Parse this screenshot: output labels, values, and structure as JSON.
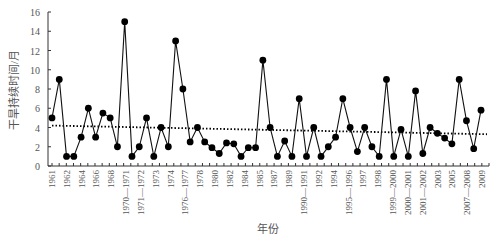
{
  "chart_data": {
    "type": "line",
    "title": "",
    "xlabel": "年份",
    "ylabel": "干旱持续时间/月",
    "ylim": [
      0,
      16
    ],
    "yticks": [
      0,
      2,
      4,
      6,
      8,
      10,
      12,
      14,
      16
    ],
    "grid": false,
    "legend": null,
    "x_tick_labels": [
      "1961",
      "1962",
      "1964",
      "1966",
      "1968",
      "1970—1971",
      "1971—1972",
      "1973",
      "1974",
      "1976—1977",
      "1978",
      "1980",
      "1982",
      "1984",
      "1985",
      "1987",
      "1989",
      "1990—1991",
      "1992",
      "1994",
      "1995—1996",
      "1997",
      "1998",
      "1999—2000",
      "2000—2001",
      "2001—2002",
      "2003",
      "2005",
      "2007—2008",
      "2009"
    ],
    "series": [
      {
        "name": "干旱持续时间",
        "style": "solid line with filled circle markers",
        "color": "#000000",
        "values": [
          5,
          9,
          1,
          1,
          3,
          6,
          3,
          5.5,
          5,
          2,
          15,
          1,
          2,
          5,
          1,
          4,
          2,
          13,
          8,
          2.5,
          4,
          2.5,
          1.9,
          1.3,
          2.4,
          2.3,
          1,
          1.9,
          1.9,
          11,
          4,
          1,
          2.6,
          1,
          7,
          1,
          4,
          1,
          2,
          3,
          7,
          4,
          1.5,
          4,
          2,
          1,
          9,
          1,
          3.8,
          1,
          7.8,
          1.3,
          4,
          3.4,
          2.9,
          2.3,
          9,
          4.7,
          1.8,
          5.8
        ]
      },
      {
        "name": "线性趋势",
        "style": "dotted line",
        "color": "#000000",
        "values_endpoints": [
          4.2,
          3.3
        ]
      }
    ]
  }
}
